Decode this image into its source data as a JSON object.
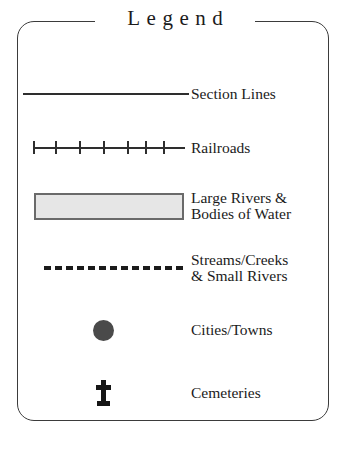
{
  "legend": {
    "title": "Legend",
    "frame_color": "#3b3b3b",
    "text_color": "#1b1b1b",
    "entries": [
      {
        "symbol": "solid-line",
        "label_line1": "Section Lines",
        "label_line2": "",
        "symbol_color": "#2e2e2e"
      },
      {
        "symbol": "hatched-line",
        "label_line1": "Railroads",
        "label_line2": "",
        "symbol_color": "#2e2e2e",
        "tick_count": 6
      },
      {
        "symbol": "filled-rectangle",
        "label_line1": "Large Rivers &",
        "label_line2": "Bodies of Water",
        "fill_color": "#e6e6e6",
        "border_color": "#6a6a6a"
      },
      {
        "symbol": "dashed-line",
        "label_line1": "Streams/Creeks",
        "label_line2": "& Small Rivers",
        "symbol_color": "#1b1b1b",
        "dash_count": 13
      },
      {
        "symbol": "filled-circle",
        "label_line1": "Cities/Towns",
        "label_line2": "",
        "symbol_color": "#4a4a4a"
      },
      {
        "symbol": "cross",
        "label_line1": "Cemeteries",
        "label_line2": "",
        "symbol_color": "#161616"
      }
    ],
    "bottom_caption": ""
  }
}
